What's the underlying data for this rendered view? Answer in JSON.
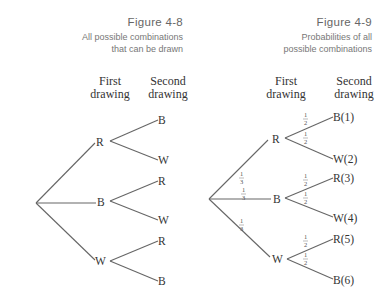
{
  "figure_4_8": {
    "number": "Figure 4-8",
    "description_line1": "All possible combinations",
    "description_line2": "that can be drawn",
    "col1_line1": "First",
    "col1_line2": "drawing",
    "col2_line1": "Second",
    "col2_line2": "drawing",
    "first_level": [
      "R",
      "B",
      "W"
    ],
    "second_level": [
      [
        "B",
        "W"
      ],
      [
        "R",
        "W"
      ],
      [
        "R",
        "B"
      ]
    ]
  },
  "figure_4_9": {
    "number": "Figure 4-9",
    "description_line1": "Probabilities of all",
    "description_line2": "possible combinations",
    "col1_line1": "First",
    "col1_line2": "drawing",
    "col2_line1": "Second",
    "col2_line2": "drawing",
    "first_level": [
      "R",
      "B",
      "W"
    ],
    "first_level_prob": {
      "num": "1",
      "den": "3"
    },
    "second_level": [
      [
        "B(1)",
        "W(2)"
      ],
      [
        "R(3)",
        "W(4)"
      ],
      [
        "R(5)",
        "B(6)"
      ]
    ],
    "second_level_prob": {
      "num": "1",
      "den": "2"
    }
  }
}
